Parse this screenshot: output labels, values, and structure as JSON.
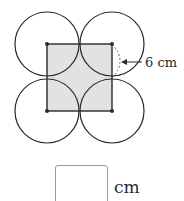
{
  "diagram": {
    "square": {
      "x1": 47,
      "y1": 44,
      "x2": 112,
      "y2": 111,
      "fill": "#e2e2e2",
      "stroke": "#2a2a2a"
    },
    "circles": [
      {
        "cx": 47,
        "cy": 44,
        "r": 32
      },
      {
        "cx": 112,
        "cy": 44,
        "r": 32
      },
      {
        "cx": 47,
        "cy": 111,
        "r": 32
      },
      {
        "cx": 112,
        "cy": 111,
        "r": 32
      }
    ],
    "circle_stroke": "#2a2a2a",
    "dimension_label": "6 cm",
    "dimension_marker": "dashed-arc-radius"
  },
  "answer": {
    "value": "",
    "unit": "cm"
  }
}
